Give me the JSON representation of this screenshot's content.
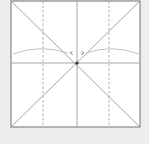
{
  "diagram": {
    "type": "origami-crease-pattern",
    "paper": {
      "x": 11,
      "y": 1,
      "size": 129,
      "fill": "#ffffff",
      "border": "#888888"
    },
    "colors": {
      "background": "#eeeeee",
      "crease": "#9a9a9a",
      "valley_dashed": "#9a9a9a",
      "arc": "#bbbbbb",
      "center_dot": "#333333"
    },
    "creases": {
      "diagonals": 2,
      "vertical_center": "solid",
      "horizontal_center": "solid",
      "vertical_quarters": "dashed"
    },
    "arrows": {
      "count": 2,
      "direction": "toward-center"
    },
    "caption": ""
  }
}
